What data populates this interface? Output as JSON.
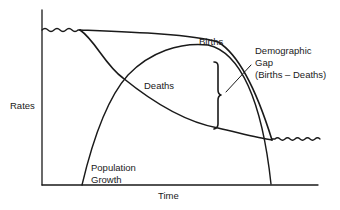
{
  "diagram": {
    "axes": {
      "y_label": "Rates",
      "x_label": "Time"
    },
    "curves": [
      {
        "name": "Births",
        "label": "Births"
      },
      {
        "name": "Deaths",
        "label": "Deaths"
      },
      {
        "name": "Population Growth",
        "label_line1": "Population",
        "label_line2": "Growth"
      }
    ],
    "annotation": {
      "line1": "Demographic",
      "line2": "Gap",
      "line3": "(Births – Deaths)"
    },
    "colors": {
      "line": "#1a1a1a",
      "background": "#ffffff"
    }
  }
}
